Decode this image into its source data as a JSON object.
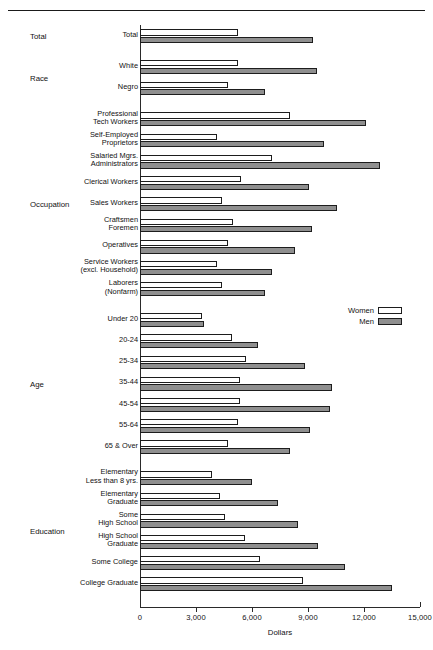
{
  "chart_data": {
    "type": "bar",
    "orientation": "horizontal",
    "title": "",
    "xlabel": "Dollars",
    "ylabel": "",
    "xlim": [
      0,
      15000
    ],
    "xticks": [
      0,
      3000,
      6000,
      9000,
      12000,
      15000
    ],
    "xticklabels": [
      "0",
      "3,000",
      "6,000",
      "9,000",
      "12,000",
      "15,000"
    ],
    "grid": false,
    "legend_position": "middle-right",
    "legend": [
      "Women",
      "Men"
    ],
    "series": [
      {
        "name": "Women",
        "color": "#ffffff"
      },
      {
        "name": "Men",
        "color": "#8f8f8f"
      }
    ],
    "groups": [
      {
        "group": "Total",
        "categories": [
          {
            "label": "Total",
            "women": 5250,
            "men": 9270
          }
        ]
      },
      {
        "group": "Race",
        "categories": [
          {
            "label": "White",
            "women": 5250,
            "men": 9500
          },
          {
            "label": "Negro",
            "women": 4720,
            "men": 6700
          }
        ]
      },
      {
        "group": "Occupation",
        "categories": [
          {
            "label": "Professional\nTech Workers",
            "women": 8050,
            "men": 12100
          },
          {
            "label": "Self-Employed\nProprietors",
            "women": 4100,
            "men": 9850
          },
          {
            "label": "Salaried Mgrs.\nAdministrators",
            "women": 7070,
            "men": 12860
          },
          {
            "label": "Clerical Workers",
            "women": 5410,
            "men": 9050
          },
          {
            "label": "Sales Workers",
            "women": 4400,
            "men": 10550
          },
          {
            "label": "Craftsmen\nForemen",
            "women": 5000,
            "men": 9200
          },
          {
            "label": "Operatives",
            "women": 4720,
            "men": 8300
          },
          {
            "label": "Service Workers\n(excl. Household)",
            "women": 4120,
            "men": 7070
          },
          {
            "label": "Laborers\n(Nonfarm)",
            "women": 4400,
            "men": 6700
          }
        ]
      },
      {
        "group": "Age",
        "categories": [
          {
            "label": "Under 20",
            "women": 3320,
            "men": 3430
          },
          {
            "label": "20-24",
            "women": 4930,
            "men": 6320
          },
          {
            "label": "25-34",
            "women": 5700,
            "men": 8840
          },
          {
            "label": "35-44",
            "women": 5350,
            "men": 10270
          },
          {
            "label": "45-54",
            "women": 5350,
            "men": 10200
          },
          {
            "label": "55-64",
            "women": 5250,
            "men": 9100
          },
          {
            "label": "65 & Over",
            "women": 4720,
            "men": 8050
          }
        ]
      },
      {
        "group": "Education",
        "categories": [
          {
            "label": "Elementary\nLess than 8 yrs.",
            "women": 3850,
            "men": 6000
          },
          {
            "label": "Elementary\nGraduate",
            "women": 4280,
            "men": 7400
          },
          {
            "label": "Some\nHigh School",
            "women": 4550,
            "men": 8460
          },
          {
            "label": "High School\nGraduate",
            "women": 5630,
            "men": 9540
          },
          {
            "label": "Some College",
            "women": 6430,
            "men": 10980
          },
          {
            "label": "College Graduate",
            "women": 8730,
            "men": 13500
          }
        ]
      }
    ]
  }
}
